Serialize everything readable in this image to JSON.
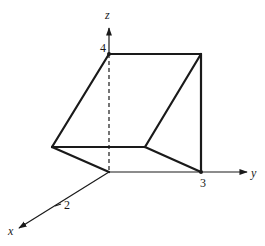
{
  "diagram": {
    "type": "3d-solid-wedge",
    "colors": {
      "ink": "#1a1a1a",
      "background": "#ffffff"
    },
    "axes": {
      "x": {
        "label": "x",
        "tick": {
          "value": "2"
        }
      },
      "y": {
        "label": "y",
        "tick": {
          "value": "3"
        }
      },
      "z": {
        "label": "z",
        "tick": {
          "value": "4"
        }
      }
    },
    "vertices": [
      {
        "name": "origin",
        "coords": [
          0,
          0,
          0
        ]
      },
      {
        "name": "A",
        "coords": [
          2,
          0,
          0
        ]
      },
      {
        "name": "B",
        "coords": [
          2,
          3,
          0
        ]
      },
      {
        "name": "C",
        "coords": [
          0,
          3,
          0
        ]
      },
      {
        "name": "D",
        "coords": [
          0,
          0,
          4
        ]
      },
      {
        "name": "E",
        "coords": [
          0,
          3,
          4
        ]
      }
    ],
    "edges": [
      {
        "from": "A",
        "to": "B",
        "style": "solid"
      },
      {
        "from": "A",
        "to": "origin",
        "style": "solid"
      },
      {
        "from": "B",
        "to": "C",
        "style": "solid"
      },
      {
        "from": "A",
        "to": "D",
        "style": "solid"
      },
      {
        "from": "B",
        "to": "E",
        "style": "solid"
      },
      {
        "from": "D",
        "to": "E",
        "style": "solid"
      },
      {
        "from": "C",
        "to": "E",
        "style": "solid"
      },
      {
        "from": "origin",
        "to": "D",
        "style": "dashed"
      }
    ]
  }
}
